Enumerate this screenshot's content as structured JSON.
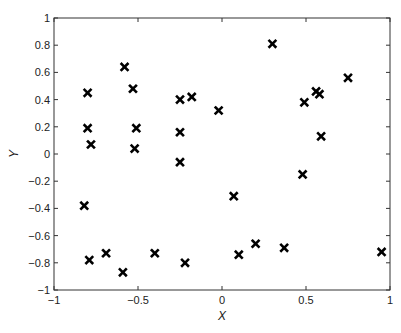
{
  "chart_data": {
    "type": "scatter",
    "title": "",
    "xlabel": "X",
    "ylabel": "Y",
    "xlim": [
      -1,
      1
    ],
    "ylim": [
      -1,
      1
    ],
    "xticks": [
      -1,
      -0.5,
      0,
      0.5,
      1
    ],
    "xtick_labels": [
      "−1",
      "−0.5",
      "0",
      "0.5",
      "1"
    ],
    "yticks": [
      -1,
      -0.8,
      -0.6,
      -0.4,
      -0.2,
      0,
      0.2,
      0.4,
      0.6,
      0.8,
      1
    ],
    "ytick_labels": [
      "−1",
      "−0.8",
      "−0.6",
      "−0.4",
      "−0.2",
      "0",
      "0.2",
      "0.4",
      "0.6",
      "0.8",
      "1"
    ],
    "grid": false,
    "legend": null,
    "marker": "x-bold",
    "marker_color": "#000000",
    "series": [
      {
        "name": "points",
        "points": [
          {
            "x": -0.58,
            "y": 0.64
          },
          {
            "x": -0.53,
            "y": 0.48
          },
          {
            "x": -0.8,
            "y": 0.45
          },
          {
            "x": -0.8,
            "y": 0.19
          },
          {
            "x": -0.51,
            "y": 0.19
          },
          {
            "x": -0.78,
            "y": 0.07
          },
          {
            "x": -0.52,
            "y": 0.04
          },
          {
            "x": -0.25,
            "y": 0.4
          },
          {
            "x": -0.18,
            "y": 0.42
          },
          {
            "x": -0.02,
            "y": 0.32
          },
          {
            "x": -0.25,
            "y": 0.16
          },
          {
            "x": -0.25,
            "y": -0.06
          },
          {
            "x": 0.3,
            "y": 0.81
          },
          {
            "x": 0.75,
            "y": 0.56
          },
          {
            "x": 0.56,
            "y": 0.46
          },
          {
            "x": 0.58,
            "y": 0.44
          },
          {
            "x": 0.49,
            "y": 0.38
          },
          {
            "x": 0.59,
            "y": 0.13
          },
          {
            "x": 0.48,
            "y": -0.15
          },
          {
            "x": 0.07,
            "y": -0.31
          },
          {
            "x": 0.2,
            "y": -0.66
          },
          {
            "x": 0.1,
            "y": -0.74
          },
          {
            "x": 0.37,
            "y": -0.69
          },
          {
            "x": 0.95,
            "y": -0.72
          },
          {
            "x": -0.82,
            "y": -0.38
          },
          {
            "x": -0.79,
            "y": -0.78
          },
          {
            "x": -0.69,
            "y": -0.73
          },
          {
            "x": -0.59,
            "y": -0.87
          },
          {
            "x": -0.4,
            "y": -0.73
          },
          {
            "x": -0.22,
            "y": -0.8
          }
        ]
      }
    ]
  }
}
